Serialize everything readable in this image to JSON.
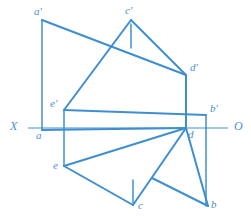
{
  "diagram": {
    "type": "descriptive-geometry-projection",
    "colors": {
      "stroke": "#3f8fd0",
      "axis": "#7fb6e0",
      "label": "#4a8fd0",
      "background": "#ffffff"
    },
    "axis": {
      "name": "ground-line",
      "left_label": "X",
      "right_label": "O",
      "y": 128,
      "x_start": 28,
      "x_end": 228
    },
    "points": [
      {
        "id": "a_prime",
        "label": "a′",
        "x": 42,
        "y": 20,
        "label_x": 34,
        "label_y": 6,
        "view": "frontal"
      },
      {
        "id": "c_prime",
        "label": "c′",
        "x": 131,
        "y": 20,
        "label_x": 125,
        "label_y": 5,
        "view": "frontal"
      },
      {
        "id": "d_prime",
        "label": "d′",
        "x": 186,
        "y": 75,
        "label_x": 190,
        "label_y": 62,
        "view": "frontal"
      },
      {
        "id": "e_prime",
        "label": "e′",
        "x": 64,
        "y": 110,
        "label_x": 50,
        "label_y": 98,
        "view": "frontal"
      },
      {
        "id": "b_prime",
        "label": "b′",
        "x": 206,
        "y": 115,
        "label_x": 210,
        "label_y": 103,
        "view": "frontal"
      },
      {
        "id": "a",
        "label": "a",
        "x": 42,
        "y": 130,
        "label_x": 36,
        "label_y": 130,
        "view": "horizontal"
      },
      {
        "id": "d",
        "label": "d",
        "x": 186,
        "y": 128,
        "label_x": 188,
        "label_y": 129,
        "view": "horizontal"
      },
      {
        "id": "e",
        "label": "e",
        "x": 64,
        "y": 166,
        "label_x": 53,
        "label_y": 160,
        "view": "horizontal"
      },
      {
        "id": "c",
        "label": "c",
        "x": 133,
        "y": 205,
        "label_x": 138,
        "label_y": 200,
        "view": "horizontal"
      },
      {
        "id": "b",
        "label": "b",
        "x": 208,
        "y": 206,
        "label_x": 211,
        "label_y": 199,
        "view": "horizontal"
      }
    ],
    "projection_lines": [
      {
        "name": "projector-a",
        "x1": 42,
        "y1": 20,
        "x2": 42,
        "y2": 130
      },
      {
        "name": "projector-e",
        "x1": 64,
        "y1": 110,
        "x2": 64,
        "y2": 166
      },
      {
        "name": "projector-d",
        "x1": 186,
        "y1": 75,
        "x2": 186,
        "y2": 128
      },
      {
        "name": "projector-b",
        "x1": 206,
        "y1": 115,
        "x2": 206,
        "y2": 206
      },
      {
        "name": "tick-c-prime",
        "x1": 131,
        "y1": 24,
        "x2": 131,
        "y2": 48
      },
      {
        "name": "tick-c",
        "x1": 133,
        "y1": 180,
        "x2": 133,
        "y2": 203
      }
    ],
    "edges": [
      {
        "name": "edge-a-prime-to-d-prime",
        "x1": 42,
        "y1": 20,
        "x2": 186,
        "y2": 75
      },
      {
        "name": "edge-e-prime-to-c-prime",
        "x1": 64,
        "y1": 110,
        "x2": 131,
        "y2": 20
      },
      {
        "name": "edge-c-prime-to-d-prime",
        "x1": 131,
        "y1": 20,
        "x2": 186,
        "y2": 75
      },
      {
        "name": "edge-e-prime-to-b-prime",
        "x1": 64,
        "y1": 110,
        "x2": 206,
        "y2": 115
      },
      {
        "name": "edge-d-prime-to-d",
        "x1": 186,
        "y1": 75,
        "x2": 186,
        "y2": 128
      },
      {
        "name": "edge-a-to-d",
        "x1": 42,
        "y1": 130,
        "x2": 186,
        "y2": 128
      },
      {
        "name": "edge-e-to-d",
        "x1": 64,
        "y1": 166,
        "x2": 186,
        "y2": 128
      },
      {
        "name": "edge-e-to-c",
        "x1": 64,
        "y1": 166,
        "x2": 133,
        "y2": 205
      },
      {
        "name": "edge-c-to-d",
        "x1": 133,
        "y1": 205,
        "x2": 186,
        "y2": 128
      },
      {
        "name": "edge-d-to-b",
        "x1": 186,
        "y1": 128,
        "x2": 208,
        "y2": 206
      },
      {
        "name": "edge-c-area-to-b",
        "x1": 152,
        "y1": 178,
        "x2": 208,
        "y2": 206
      }
    ]
  }
}
